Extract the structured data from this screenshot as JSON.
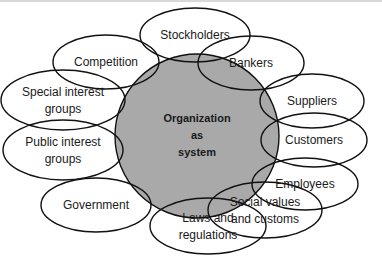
{
  "diagram": {
    "type": "environmental-system-diagram",
    "colors": {
      "background": "#ffffff",
      "center_fill": "#a9a9a9",
      "stroke": "#111111",
      "text": "#1a1a1a"
    },
    "center": {
      "id": "organization",
      "lines": [
        "Organization",
        "as",
        "system"
      ],
      "cx": 197,
      "cy": 136,
      "r": 82
    },
    "nodes": [
      {
        "id": "stockholders",
        "lines": [
          "Stockholders"
        ],
        "cx": 195,
        "cy": 35,
        "rx": 55,
        "ry": 27
      },
      {
        "id": "competition",
        "lines": [
          "Competition"
        ],
        "cx": 106,
        "cy": 62,
        "rx": 53,
        "ry": 27
      },
      {
        "id": "bankers",
        "lines": [
          "Bankers"
        ],
        "cx": 251,
        "cy": 63,
        "rx": 53,
        "ry": 27
      },
      {
        "id": "special-interest-groups",
        "lines": [
          "Special interest",
          "groups"
        ],
        "cx": 63,
        "cy": 100,
        "rx": 62,
        "ry": 30
      },
      {
        "id": "suppliers",
        "lines": [
          "Suppliers"
        ],
        "cx": 312,
        "cy": 101,
        "rx": 52,
        "ry": 27
      },
      {
        "id": "public-interest-groups",
        "lines": [
          "Public interest",
          "groups"
        ],
        "cx": 63,
        "cy": 150,
        "rx": 60,
        "ry": 30
      },
      {
        "id": "customers",
        "lines": [
          "Customers"
        ],
        "cx": 314,
        "cy": 140,
        "rx": 53,
        "ry": 27
      },
      {
        "id": "employees",
        "lines": [
          "Employees"
        ],
        "cx": 305,
        "cy": 184,
        "rx": 53,
        "ry": 26
      },
      {
        "id": "government",
        "lines": [
          "Government"
        ],
        "cx": 96,
        "cy": 205,
        "rx": 55,
        "ry": 27
      },
      {
        "id": "social-values",
        "lines": [
          "Social values",
          "and customs"
        ],
        "cx": 265,
        "cy": 210,
        "rx": 57,
        "ry": 28
      },
      {
        "id": "laws-regulations",
        "lines": [
          "Laws and",
          "regulations"
        ],
        "cx": 208,
        "cy": 226,
        "rx": 58,
        "ry": 28
      }
    ]
  }
}
